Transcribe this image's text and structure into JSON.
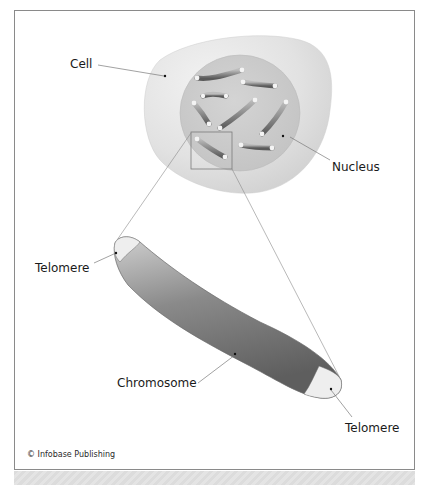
{
  "figure": {
    "labels": {
      "cell": "Cell",
      "nucleus": "Nucleus",
      "telomere_top": "Telomere",
      "chromosome": "Chromosome",
      "telomere_bottom": "Telomere"
    },
    "credit": "© Infobase Publishing"
  },
  "colors": {
    "cell_fill": "#e3e3e3",
    "nucleus_fill": "#cdcdcd",
    "chromosome_dark": "#6e6e6e",
    "chromosome_light": "#c9c9c9",
    "telomere_fill": "#eeeeee",
    "frame_border": "#8a8a8a",
    "band": "#dfdfdf"
  }
}
